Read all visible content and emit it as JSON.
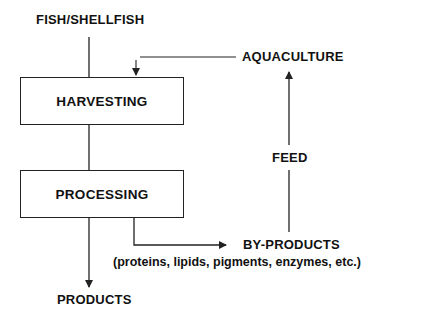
{
  "diagram": {
    "nodes": {
      "source": "FISH/SHELLFISH",
      "harvesting": "HARVESTING",
      "processing": "PROCESSING",
      "products": "PRODUCTS",
      "byproducts": "BY-PRODUCTS",
      "byproducts_detail": "(proteins, lipids, pigments, enzymes, etc.)",
      "aquaculture": "AQUACULTURE"
    },
    "edge_labels": {
      "feed": "FEED"
    },
    "edges": [
      {
        "from": "FISH/SHELLFISH",
        "to": "HARVESTING"
      },
      {
        "from": "HARVESTING",
        "to": "PROCESSING"
      },
      {
        "from": "PROCESSING",
        "to": "PRODUCTS"
      },
      {
        "from": "PROCESSING",
        "to": "BY-PRODUCTS"
      },
      {
        "from": "BY-PRODUCTS",
        "to": "AQUACULTURE",
        "label": "FEED"
      },
      {
        "from": "AQUACULTURE",
        "to": "HARVESTING"
      }
    ],
    "colors": {
      "line": "#222222",
      "text": "#111111",
      "background": "#ffffff"
    }
  }
}
